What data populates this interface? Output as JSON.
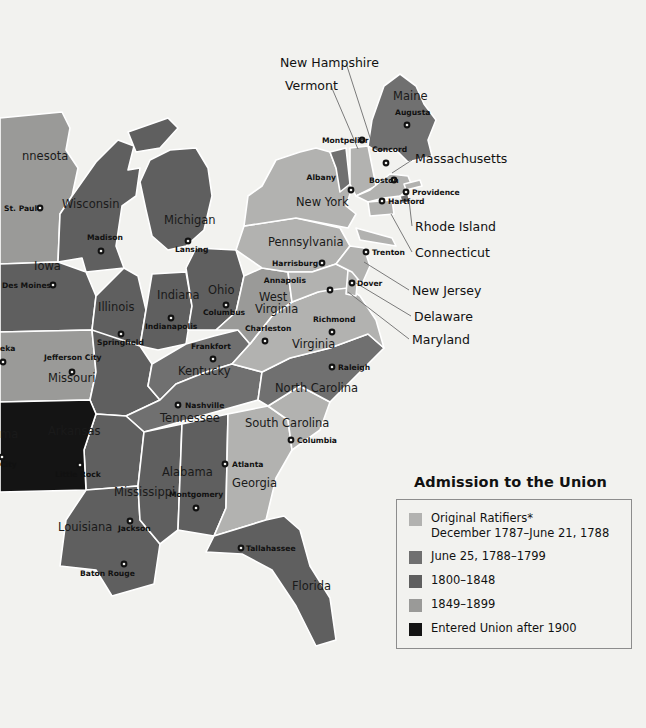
{
  "map": {
    "title": "Admission to the Union Map of the Eastern United States",
    "background_color": "#f2f2ef",
    "border_color": "#ffffff",
    "colors": {
      "original_ratifiers": "#b2b2b0",
      "june_1788_1799": "#707070",
      "y1800_1848": "#5f5f5f",
      "y1849_1899": "#9a9a98",
      "after_1900": "#141414",
      "water": "#f2f2ef"
    },
    "states": [
      {
        "name": "Minnesota",
        "label": "nnesota",
        "x": 22,
        "y": 160,
        "class": "y1849_1899"
      },
      {
        "name": "Wisconsin",
        "label": "Wisconsin",
        "x": 62,
        "y": 208,
        "class": "y1800_1848"
      },
      {
        "name": "Michigan",
        "label": "Michigan",
        "x": 164,
        "y": 224,
        "class": "y1800_1848"
      },
      {
        "name": "Iowa",
        "label": "Iowa",
        "x": 34,
        "y": 270,
        "class": "y1800_1848"
      },
      {
        "name": "Illinois",
        "label": "Illinois",
        "x": 98,
        "y": 311,
        "class": "y1800_1848"
      },
      {
        "name": "Indiana",
        "label": "Indiana",
        "x": 157,
        "y": 299,
        "class": "y1800_1848"
      },
      {
        "name": "Ohio",
        "label": "Ohio",
        "x": 208,
        "y": 294,
        "class": "y1800_1848"
      },
      {
        "name": "Missouri",
        "label": "Missouri",
        "x": 48,
        "y": 382,
        "class": "y1800_1848"
      },
      {
        "name": "Kentucky",
        "label": "Kentucky",
        "x": 178,
        "y": 375,
        "class": "june_1788_1799"
      },
      {
        "name": "Tennessee",
        "label": "Tennessee",
        "x": 160,
        "y": 422,
        "class": "june_1788_1799"
      },
      {
        "name": "Arkansas",
        "label": "Arkansas",
        "x": 48,
        "y": 435,
        "class": "y1800_1848"
      },
      {
        "name": "Mississippi",
        "label": "Mississippi",
        "x": 114,
        "y": 496,
        "class": "y1800_1848"
      },
      {
        "name": "Alabama",
        "label": "Alabama",
        "x": 162,
        "y": 476,
        "class": "y1800_1848"
      },
      {
        "name": "Louisiana",
        "label": "Louisiana",
        "x": 58,
        "y": 531,
        "class": "y1800_1848"
      },
      {
        "name": "Georgia",
        "label": "Georgia",
        "x": 232,
        "y": 487,
        "class": "original_ratifiers"
      },
      {
        "name": "Florida",
        "label": "Florida",
        "x": 292,
        "y": 590,
        "class": "y1800_1848"
      },
      {
        "name": "South Carolina",
        "label": "South Carolina",
        "x": 245,
        "y": 427,
        "class": "original_ratifiers"
      },
      {
        "name": "North Carolina",
        "label": "North Carolina",
        "x": 275,
        "y": 392,
        "class": "june_1788_1799"
      },
      {
        "name": "Virginia",
        "label": "Virginia",
        "x": 292,
        "y": 348,
        "class": "original_ratifiers"
      },
      {
        "name": "West Virginia",
        "label": "West",
        "x": 259,
        "y": 301,
        "class": "y1849_1899"
      },
      {
        "name": "West Virginia2",
        "label": "Virginia",
        "x": 255,
        "y": 313,
        "class": "y1849_1899"
      },
      {
        "name": "Pennsylvania",
        "label": "Pennsylvania",
        "x": 268,
        "y": 246,
        "class": "original_ratifiers"
      },
      {
        "name": "New York",
        "label": "New York",
        "x": 296,
        "y": 206,
        "class": "original_ratifiers"
      },
      {
        "name": "Maine",
        "label": "Maine",
        "x": 393,
        "y": 100,
        "class": "june_1788_1799"
      },
      {
        "name": "Oklahoma",
        "label": "ma",
        "x": 0,
        "y": 438,
        "class": "after_1900"
      }
    ],
    "cities": [
      {
        "name": "St. Paul",
        "label": "St. Paul",
        "lx": 4,
        "ly": 211,
        "dx": 40,
        "dy": 208,
        "anchor": "start"
      },
      {
        "name": "Madison",
        "label": "Madison",
        "lx": 87,
        "ly": 240,
        "dx": 101,
        "dy": 251,
        "anchor": "start"
      },
      {
        "name": "Lansing",
        "label": "Lansing",
        "lx": 175,
        "ly": 252,
        "dx": 188,
        "dy": 241,
        "anchor": "start"
      },
      {
        "name": "Des Moines",
        "label": "Des Moines",
        "lx": 2,
        "ly": 288,
        "dx": 53,
        "dy": 285,
        "anchor": "start"
      },
      {
        "name": "Springfield",
        "label": "Springfield",
        "lx": 97,
        "ly": 345,
        "dx": 121,
        "dy": 334,
        "anchor": "start"
      },
      {
        "name": "Indianapolis",
        "label": "Indianapolis",
        "lx": 145,
        "ly": 329,
        "dx": 171,
        "dy": 318,
        "anchor": "start"
      },
      {
        "name": "Columbus",
        "label": "Columbus",
        "lx": 203,
        "ly": 315,
        "dx": 226,
        "dy": 305,
        "anchor": "start"
      },
      {
        "name": "Frankfort",
        "label": "Frankfort",
        "lx": 191,
        "ly": 349,
        "dx": 213,
        "dy": 359,
        "anchor": "start"
      },
      {
        "name": "Jefferson City",
        "label": "Jefferson City",
        "lx": 44,
        "ly": 360,
        "dx": 72,
        "dy": 372,
        "anchor": "start"
      },
      {
        "name": "Topeka",
        "label": "eka",
        "lx": 0,
        "ly": 351,
        "dx": 3,
        "dy": 362,
        "anchor": "start"
      },
      {
        "name": "Nashville",
        "label": "Nashville",
        "lx": 185,
        "ly": 408,
        "dx": 178,
        "dy": 405,
        "anchor": "start"
      },
      {
        "name": "Little Rock",
        "label": "Little Rock",
        "lx": 55,
        "ly": 477,
        "dx": 80,
        "dy": 465,
        "anchor": "start"
      },
      {
        "name": "Oklahoma City",
        "label": "City",
        "lx": 0,
        "ly": 467,
        "dx": 2,
        "dy": 457,
        "anchor": "start"
      },
      {
        "name": "Montgomery",
        "label": "Montgomery",
        "lx": 169,
        "ly": 497,
        "dx": 196,
        "dy": 508,
        "anchor": "start"
      },
      {
        "name": "Jackson",
        "label": "Jackson",
        "lx": 118,
        "ly": 531,
        "dx": 130,
        "dy": 521,
        "anchor": "start"
      },
      {
        "name": "Baton Rouge",
        "label": "Baton Rouge",
        "lx": 80,
        "ly": 576,
        "dx": 124,
        "dy": 564,
        "anchor": "start"
      },
      {
        "name": "Tallahassee",
        "label": "Tallahassee",
        "lx": 246,
        "ly": 551,
        "dx": 241,
        "dy": 548,
        "anchor": "start"
      },
      {
        "name": "Atlanta",
        "label": "Atlanta",
        "lx": 232,
        "ly": 467,
        "dx": 225,
        "dy": 464,
        "anchor": "start"
      },
      {
        "name": "Columbia",
        "label": "Columbia",
        "lx": 297,
        "ly": 443,
        "dx": 291,
        "dy": 440,
        "anchor": "start"
      },
      {
        "name": "Raleigh",
        "label": "Raleigh",
        "lx": 338,
        "ly": 370,
        "dx": 332,
        "dy": 367,
        "anchor": "start"
      },
      {
        "name": "Richmond",
        "label": "Richmond",
        "lx": 313,
        "ly": 322,
        "dx": 332,
        "dy": 332,
        "anchor": "start"
      },
      {
        "name": "Charleston",
        "label": "Charleston",
        "lx": 245,
        "ly": 331,
        "dx": 265,
        "dy": 341,
        "anchor": "start"
      },
      {
        "name": "Annapolis",
        "label": "Annapolis",
        "lx": 306,
        "ly": 283,
        "dx": 330,
        "dy": 290,
        "anchor": "end"
      },
      {
        "name": "Dover",
        "label": "Dover",
        "lx": 357,
        "ly": 286,
        "dx": 352,
        "dy": 283,
        "anchor": "start"
      },
      {
        "name": "Trenton",
        "label": "Trenton",
        "lx": 372,
        "ly": 255,
        "dx": 366,
        "dy": 252,
        "anchor": "start"
      },
      {
        "name": "Harrisburg",
        "label": "Harrisburg",
        "lx": 272,
        "ly": 266,
        "dx": 322,
        "dy": 263,
        "anchor": "start"
      },
      {
        "name": "Albany",
        "label": "Albany",
        "lx": 336,
        "ly": 180,
        "dx": 351,
        "dy": 190,
        "anchor": "end"
      },
      {
        "name": "Montpelier",
        "label": "Montpelier",
        "lx": 322,
        "ly": 143,
        "dx": 362,
        "dy": 140,
        "anchor": "start"
      },
      {
        "name": "Concord",
        "label": "Concord",
        "lx": 372,
        "ly": 152,
        "dx": 386,
        "dy": 163,
        "anchor": "start"
      },
      {
        "name": "Augusta",
        "label": "Augusta",
        "lx": 395,
        "ly": 115,
        "dx": 407,
        "dy": 125,
        "anchor": "start"
      },
      {
        "name": "Boston",
        "label": "Boston",
        "lx": 369,
        "ly": 183,
        "dx": 394,
        "dy": 180,
        "anchor": "start"
      },
      {
        "name": "Providence",
        "label": "Providence",
        "lx": 412,
        "ly": 195,
        "dx": 406,
        "dy": 192,
        "anchor": "start"
      },
      {
        "name": "Hartford",
        "label": "Hartford",
        "lx": 388,
        "ly": 204,
        "dx": 382,
        "dy": 201,
        "anchor": "start"
      }
    ],
    "callouts": [
      {
        "name": "New Hampshire",
        "label": "New Hampshire",
        "tx": 280,
        "ty": 67,
        "x1": 346,
        "y1": 63,
        "x2": 374,
        "y2": 150
      },
      {
        "name": "Vermont",
        "label": "Vermont",
        "tx": 285,
        "ty": 90,
        "x1": 331,
        "y1": 86,
        "x2": 358,
        "y2": 149
      },
      {
        "name": "Massachusetts",
        "label": "Massachusetts",
        "tx": 415,
        "ty": 163,
        "x1": 412,
        "y1": 160,
        "x2": 392,
        "y2": 173
      },
      {
        "name": "Rhode Island",
        "label": "Rhode Island",
        "tx": 415,
        "ty": 231,
        "x1": 412,
        "y1": 226,
        "x2": 409,
        "y2": 200
      },
      {
        "name": "Connecticut",
        "label": "Connecticut",
        "tx": 415,
        "ty": 257,
        "x1": 412,
        "y1": 252,
        "x2": 391,
        "y2": 214
      },
      {
        "name": "New Jersey",
        "label": "New Jersey",
        "tx": 412,
        "ty": 295,
        "x1": 409,
        "y1": 290,
        "x2": 364,
        "y2": 262
      },
      {
        "name": "Delaware",
        "label": "Delaware",
        "tx": 414,
        "ty": 321,
        "x1": 411,
        "y1": 316,
        "x2": 356,
        "y2": 283
      },
      {
        "name": "Maryland",
        "label": "Maryland",
        "tx": 412,
        "ty": 344,
        "x1": 409,
        "y1": 339,
        "x2": 348,
        "y2": 292
      }
    ]
  },
  "legend": {
    "title": "Admission to the Union",
    "border_color": "#8d8d8d",
    "items": [
      {
        "name": "original-ratifiers",
        "line1": "Original Ratifiers*",
        "line2": "December 1787–June 21, 1788",
        "color": "#b2b2b0"
      },
      {
        "name": "june-1788-1799",
        "line1": "June 25, 1788–1799",
        "line2": "",
        "color": "#707070"
      },
      {
        "name": "1800-1848",
        "line1": "1800–1848",
        "line2": "",
        "color": "#5f5f5f"
      },
      {
        "name": "1849-1899",
        "line1": "1849–1899",
        "line2": "",
        "color": "#9a9a98"
      },
      {
        "name": "after-1900",
        "line1": "Entered Union after 1900",
        "line2": "",
        "color": "#141414"
      }
    ]
  }
}
